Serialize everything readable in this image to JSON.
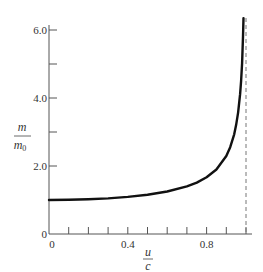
{
  "chart_data": {
    "type": "line",
    "title": "",
    "xlabel": "u/c",
    "ylabel": "m/m0",
    "xlabel_parts": {
      "numerator": "u",
      "denominator": "c"
    },
    "ylabel_parts": {
      "numerator": "m",
      "denominator": "m",
      "subscript": "0"
    },
    "xlim": [
      0,
      1.0
    ],
    "ylim": [
      0,
      6.3
    ],
    "x_ticks": [
      0,
      0.1,
      0.2,
      0.3,
      0.4,
      0.5,
      0.6,
      0.7,
      0.8,
      0.9,
      1.0
    ],
    "x_tick_labels": [
      {
        "value": 0,
        "label": "0"
      },
      {
        "value": 0.4,
        "label": "0.4"
      },
      {
        "value": 0.8,
        "label": "0.8"
      }
    ],
    "y_ticks": [
      2.0,
      3.0,
      4.0,
      5.0,
      6.0
    ],
    "y_tick_labels": [
      {
        "value": 0,
        "label": "0"
      },
      {
        "value": 2.0,
        "label": "2.0"
      },
      {
        "value": 4.0,
        "label": "4.0"
      },
      {
        "value": 6.0,
        "label": "6.0"
      }
    ],
    "grid": false,
    "legend": null,
    "series": [
      {
        "name": "relativistic mass ratio",
        "x": [
          0,
          0.1,
          0.2,
          0.3,
          0.4,
          0.5,
          0.6,
          0.7,
          0.75,
          0.8,
          0.85,
          0.9,
          0.92,
          0.94,
          0.95,
          0.96,
          0.97,
          0.975,
          0.98,
          0.985,
          0.9875
        ],
        "y": [
          1.0,
          1.005,
          1.021,
          1.048,
          1.091,
          1.155,
          1.25,
          1.4,
          1.512,
          1.667,
          1.898,
          2.294,
          2.552,
          2.931,
          3.203,
          3.571,
          4.113,
          4.5,
          5.025,
          5.799,
          6.35
        ]
      }
    ],
    "annotations": [
      {
        "type": "vertical-dashed-line",
        "x": 1.0,
        "description": "asymptote at u = c"
      }
    ]
  }
}
